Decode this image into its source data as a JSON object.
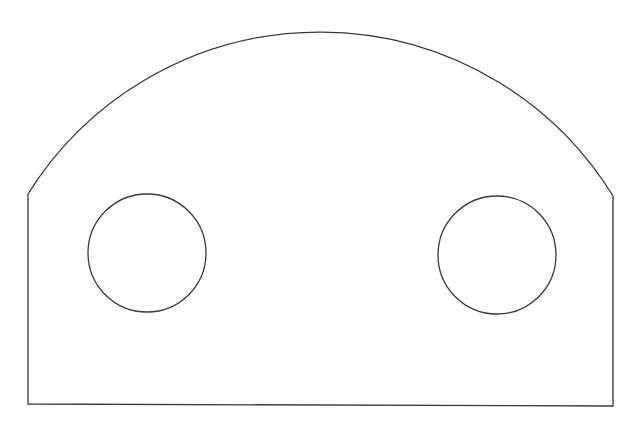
{
  "diagram": {
    "title": "",
    "elements": [
      {
        "kind": "outline",
        "shape": "rectangle-with-arched-top"
      },
      {
        "kind": "hole",
        "shape": "circle",
        "position": "left"
      },
      {
        "kind": "hole",
        "shape": "circle",
        "position": "right"
      }
    ],
    "colors": {
      "background": "#ffffff",
      "line": "#3a3a3a"
    }
  }
}
